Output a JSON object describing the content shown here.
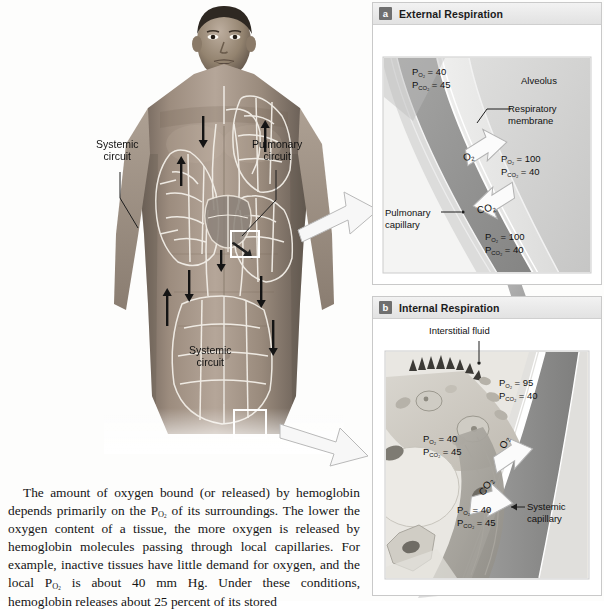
{
  "figure": {
    "body_diagram": {
      "labels": [
        {
          "id": "systemic-circuit-upper",
          "text_line1": "Systemic",
          "text_line2": "circuit"
        },
        {
          "id": "pulmonary-circuit",
          "text_line1": "Pulmonary",
          "text_line2": "circuit"
        },
        {
          "id": "systemic-circuit-lower",
          "text_line1": "Systemic",
          "text_line2": "circuit"
        }
      ],
      "callout_boxes": [
        {
          "id": "callout-a",
          "links_to": "a"
        },
        {
          "id": "callout-b",
          "links_to": "b"
        }
      ]
    },
    "panels": [
      {
        "id": "a",
        "badge": "a",
        "title": "External Respiration",
        "region_labels": [
          {
            "id": "alveolus",
            "text": "Alveolus"
          },
          {
            "id": "respiratory-membrane",
            "line1": "Respiratory",
            "line2": "membrane"
          },
          {
            "id": "pulmonary-capillary",
            "line1": "Pulmonary",
            "line2": "capillary"
          }
        ],
        "pressure_labels": [
          {
            "id": "capillary-in",
            "o2": "P",
            "o2_sub": "O",
            "o2_sub2": "2",
            "o2_val": "= 40",
            "co2_val": "= 45"
          },
          {
            "id": "alveolus-gas",
            "o2_val": "= 100",
            "co2_val": "= 40"
          },
          {
            "id": "capillary-out",
            "o2_val": "= 100",
            "co2_val": "= 40"
          }
        ],
        "pressure_text": {
          "capillary_in_po2": "P O2 = 40",
          "capillary_in_pco2": "P CO2 = 45",
          "alveolus_po2": "P O2 = 100",
          "alveolus_pco2": "P CO2 = 40",
          "capillary_out_po2": "P O2 = 100",
          "capillary_out_pco2": "P CO2 = 40"
        },
        "values": {
          "capillary_in_po2": "40",
          "capillary_in_pco2": "45",
          "alveolus_po2": "100",
          "alveolus_pco2": "40",
          "capillary_out_po2": "100",
          "capillary_out_pco2": "40"
        },
        "gas_arrows": [
          {
            "id": "o2-arrow",
            "gas": "O",
            "sub": "2",
            "direction": "into-capillary"
          },
          {
            "id": "co2-arrow",
            "gas": "CO",
            "sub": "2",
            "direction": "into-alveolus"
          }
        ]
      },
      {
        "id": "b",
        "badge": "b",
        "title": "Internal Respiration",
        "region_labels": [
          {
            "id": "interstitial-fluid",
            "text": "Interstitial fluid"
          },
          {
            "id": "systemic-capillary",
            "line1": "Systemic",
            "line2": "capillary"
          }
        ],
        "values": {
          "capillary_in_po2": "95",
          "capillary_in_pco2": "40",
          "tissue_po2": "40",
          "tissue_pco2": "45",
          "capillary_out_po2": "40",
          "capillary_out_pco2": "45"
        },
        "gas_arrows": [
          {
            "id": "o2-arrow",
            "gas": "O",
            "sub": "2",
            "direction": "into-tissue"
          },
          {
            "id": "co2-arrow",
            "gas": "CO",
            "sub": "2",
            "direction": "into-capillary"
          }
        ]
      }
    ],
    "symbols": {
      "P": "P",
      "O2_sub": "O2",
      "CO2_sub": "CO2",
      "equals": "=",
      "O2": "O2",
      "CO2": "CO2"
    }
  },
  "body_copy": {
    "paragraph": "The amount of oxygen bound (or released) by hemoglobin depends primarily on the PO2 of its surroundings. The lower the oxygen content of a tissue, the more oxygen is released by hemoglobin molecules passing through local capillaries. For example, inactive tissues have little demand for oxygen, and the local PO2 is about 40 mm Hg. Under these conditions, hemoglobin releases about 25 percent of its stored"
  },
  "colors": {
    "badge_bg": "#6f6f6f",
    "panel_border": "#c9c9c9",
    "header_bg": "#ececec",
    "arrow_gray": "#8e8e8e",
    "alveolus_fill": "#d7d7d7",
    "capillary_fill": "#9a9a9a",
    "text": "#1a1a1a"
  }
}
